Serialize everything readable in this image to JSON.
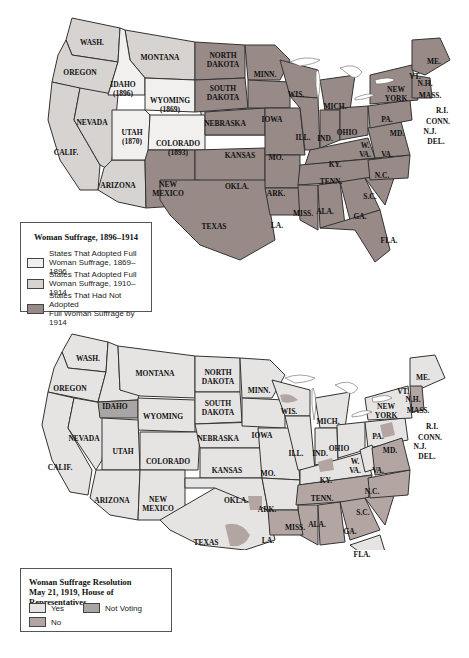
{
  "colors": {
    "adopted_1869_1896": "#f2f0ef",
    "adopted_1910_1914": "#d6d3d1",
    "not_adopted": "#978a87",
    "yes": "#e6e4e3",
    "not_voting": "#a8a5a4",
    "no": "#b3a6a2",
    "border": "#333333"
  },
  "map1": {
    "legend": {
      "title": "Woman Suffrage, 1896–1914",
      "items": [
        {
          "label_line1": "States That Adopted Full",
          "label_line2": "Woman Suffrage, 1869–1896"
        },
        {
          "label_line1": "States That Adopted Full",
          "label_line2": "Woman Suffrage, 1910–1914"
        },
        {
          "label_line1": "States That Had Not Adopted",
          "label_line2": "Full Woman Suffrage by 1914"
        }
      ]
    },
    "labels": {
      "wash": "WASH.",
      "oregon": "OREGON",
      "calif": "CALIF.",
      "nevada": "NEVADA",
      "idaho": "IDAHO",
      "idaho_year": "(1896)",
      "montana": "MONTANA",
      "wyoming": "WYOMING",
      "wyoming_year": "(1869)",
      "utah": "UTAH",
      "utah_year": "(1870)",
      "colorado": "COLORADO",
      "colorado_year": "(1893)",
      "arizona": "ARIZONA",
      "new": "NEW",
      "mexico": "MEXICO",
      "north": "NORTH",
      "dakota": "DAKOTA",
      "south": "SOUTH",
      "nebraska": "NEBRASKA",
      "kansas": "KANSAS",
      "okla": "OKLA.",
      "texas": "TEXAS",
      "minn": "MINN.",
      "iowa": "IOWA",
      "mo": "MO.",
      "ark": "ARK.",
      "la": "LA.",
      "wis": "WIS.",
      "ill": "ILL.",
      "mich": "MICH.",
      "ind": "IND.",
      "ohio": "OHIO",
      "ky": "KY.",
      "tenn": "TENN.",
      "miss": "MISS.",
      "ala": "ALA.",
      "ga": "GA.",
      "fla": "FLA.",
      "sc": "S.C.",
      "nc": "N.C.",
      "va": "VA.",
      "w": "W.",
      "wva_va": "VA.",
      "pa": "PA.",
      "md": "MD.",
      "york": "YORK",
      "vt": "VT.",
      "nh": "N.H.",
      "me": "ME.",
      "mass": "MASS.",
      "ri": "R.I.",
      "conn": "CONN.",
      "nj": "N.J.",
      "del": "DEL."
    }
  },
  "map2": {
    "legend": {
      "title_line1": "Woman Suffrage Resolution",
      "title_line2": "May 21, 1919, House of Representatives",
      "items": [
        {
          "label": "Yes"
        },
        {
          "label": "Not Voting"
        },
        {
          "label": "No"
        }
      ]
    },
    "labels": {
      "wash": "WASH.",
      "oregon": "OREGON",
      "calif": "CALIF.",
      "nevada": "NEVADA",
      "idaho": "IDAHO",
      "montana": "MONTANA",
      "wyoming": "WYOMING",
      "utah": "UTAH",
      "colorado": "COLORADO",
      "arizona": "ARIZONA",
      "new": "NEW",
      "mexico": "MEXICO",
      "north": "NORTH",
      "dakota": "DAKOTA",
      "south": "SOUTH",
      "nebraska": "NEBRASKA",
      "kansas": "KANSAS",
      "okla": "OKLA.",
      "texas": "TEXAS",
      "minn": "MINN.",
      "iowa": "IOWA",
      "mo": "MO.",
      "ark": "ARK.",
      "la": "LA.",
      "wis": "WIS.",
      "ill": "ILL.",
      "mich": "MICH.",
      "ind": "IND.",
      "ohio": "OHIO",
      "ky": "KY.",
      "tenn": "TENN.",
      "miss": "MISS.",
      "ala": "ALA.",
      "ga": "GA.",
      "fla": "FLA.",
      "sc": "S.C.",
      "nc": "N.C.",
      "va": "VA.",
      "w": "W.",
      "wva_va": "VA.",
      "pa": "PA.",
      "md": "MD.",
      "york": "YORK",
      "vt": "VT.",
      "nh": "N.H.",
      "me": "ME.",
      "mass": "MASS.",
      "ri": "R.I.",
      "conn": "CONN.",
      "nj": "N.J.",
      "del": "DEL."
    }
  }
}
